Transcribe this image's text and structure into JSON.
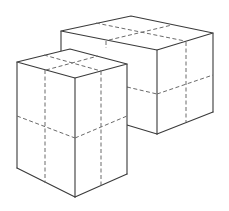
{
  "diagram": {
    "title": "",
    "colors": {
      "background": "#ffffff",
      "edge": "#3a3a3a",
      "grid_line": "#6a6a6a"
    },
    "shapes": [
      {
        "name": "back-box",
        "kind": "rectangular-prism",
        "grid": "2x2 per face",
        "orientation": "wide, short"
      },
      {
        "name": "front-box",
        "kind": "rectangular-prism",
        "grid": "2x2 per face",
        "orientation": "tall, narrow"
      }
    ]
  }
}
